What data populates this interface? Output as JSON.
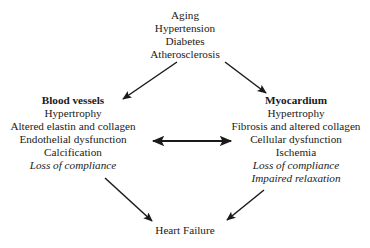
{
  "diagram": {
    "risk_factors": {
      "lines": [
        {
          "text": "Aging",
          "style": "normal"
        },
        {
          "text": "Hypertension",
          "style": "normal"
        },
        {
          "text": "Diabetes",
          "style": "normal"
        },
        {
          "text": "Atherosclerosis",
          "style": "normal"
        }
      ]
    },
    "blood_vessels": {
      "lines": [
        {
          "text": "Blood vessels",
          "style": "bold"
        },
        {
          "text": "Hypertrophy",
          "style": "normal"
        },
        {
          "text": "Altered elastin and collagen",
          "style": "normal"
        },
        {
          "text": "Endothelial dysfunction",
          "style": "normal"
        },
        {
          "text": "Calcification",
          "style": "normal"
        },
        {
          "text": "Loss of compliance",
          "style": "italic"
        }
      ]
    },
    "myocardium": {
      "lines": [
        {
          "text": "Myocardium",
          "style": "bold"
        },
        {
          "text": "Hypertrophy",
          "style": "normal"
        },
        {
          "text": "Fibrosis and altered collagen",
          "style": "normal"
        },
        {
          "text": "Cellular dysfunction",
          "style": "normal"
        },
        {
          "text": "Ischemia",
          "style": "normal"
        },
        {
          "text": "Loss of compliance",
          "style": "italic"
        },
        {
          "text": "Impaired relaxation",
          "style": "italic"
        }
      ]
    },
    "outcome": {
      "lines": [
        {
          "text": "Heart Failure",
          "style": "normal"
        }
      ]
    },
    "connectors": [
      {
        "name": "risk-to-blood-vessels",
        "direction": "down-left",
        "heads": 1
      },
      {
        "name": "risk-to-myocardium",
        "direction": "down-right",
        "heads": 1
      },
      {
        "name": "blood-vessels-to-myocardium",
        "direction": "horizontal",
        "heads": 2
      },
      {
        "name": "blood-vessels-to-heart-failure",
        "direction": "down-right",
        "heads": 1
      },
      {
        "name": "myocardium-to-heart-failure",
        "direction": "down-left",
        "heads": 1
      }
    ],
    "colors": {
      "background": "#ffffff",
      "text": "#1a1a1a",
      "arrow": "#1a1a1a"
    }
  }
}
